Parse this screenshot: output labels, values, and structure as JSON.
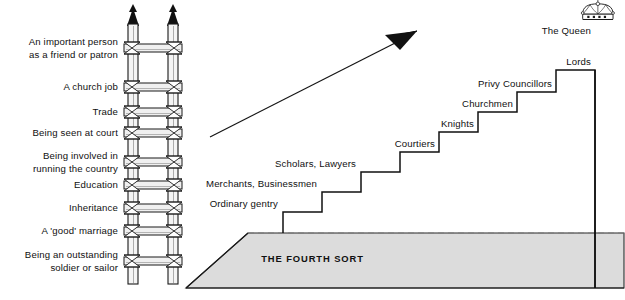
{
  "diagram": {
    "title_text_in_base": "THE FOURTH SORT",
    "colors": {
      "base_fill": "#dcdcdc",
      "base_stroke": "#222222",
      "line": "#111111",
      "ladder_fill": "#f2f2f2",
      "ladder_stroke": "#1a1a1a",
      "dashed_line": "#7a7a7a"
    },
    "ladder": {
      "name": "ladder-of-advancement",
      "rungs": [
        {
          "label": "An important person\nas a friend or patron",
          "y": 48
        },
        {
          "label": "A church job",
          "y": 87
        },
        {
          "label": "Trade",
          "y": 112
        },
        {
          "label": "Being seen at court",
          "y": 133
        },
        {
          "label": "Being involved in\nrunning the country",
          "y": 162
        },
        {
          "label": "Education",
          "y": 185
        },
        {
          "label": "Inheritance",
          "y": 208
        },
        {
          "label": "A 'good' marriage",
          "y": 231
        },
        {
          "label": "Being an outstanding\nsoldier or sailor",
          "y": 261
        }
      ]
    },
    "arrow": {
      "name": "upward-progress-arrow",
      "from": [
        210,
        137
      ],
      "to": [
        415,
        33
      ]
    },
    "staircase": {
      "name": "social-hierarchy-staircase",
      "steps": [
        {
          "label": "Ordinary gentry",
          "label_x": 330,
          "label_y": 196
        },
        {
          "label": "Merchants, Businessmen",
          "label_x": 360,
          "label_y": 176
        },
        {
          "label": "Scholars, Lawyers",
          "label_x": 399,
          "label_y": 155
        },
        {
          "label": "Courtiers",
          "label_x": 438,
          "label_y": 139
        },
        {
          "label": "Knights",
          "label_x": 477,
          "label_y": 119
        },
        {
          "label": "Churchmen",
          "label_x": 516,
          "label_y": 98
        },
        {
          "label": "Privy Councillors",
          "label_x": 554,
          "label_y": 82
        },
        {
          "label": "Lords",
          "label_x": 592,
          "label_y": 58
        }
      ],
      "top_label": "The Queen",
      "top_label_x": 612,
      "top_label_y": 28,
      "crown_icon": "crown-icon"
    }
  }
}
